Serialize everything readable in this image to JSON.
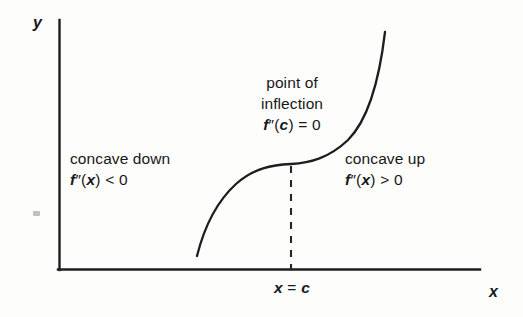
{
  "figure": {
    "background_color": "#fdfdfc",
    "ink_color": "#16181a"
  },
  "axes": {
    "y_label": "y",
    "x_label": "x",
    "origin": {
      "x": 59,
      "y": 270
    },
    "y_axis_top": 20,
    "x_axis_right": 480
  },
  "labels": {
    "point_of_inflection_line1": "point of",
    "point_of_inflection_line2": "inflection",
    "point_of_inflection_condition": "f″(c) = 0",
    "concave_down_title": "concave down",
    "concave_down_condition": "f″(x) < 0",
    "concave_up_title": "concave up",
    "concave_up_condition": "f″(x) > 0",
    "x_equals_c": "x = c"
  },
  "chart_data": {
    "type": "line",
    "title": "",
    "xlabel": "x",
    "ylabel": "y",
    "grid": false,
    "legend": "none",
    "annotations": [
      {
        "name": "point-of-inflection",
        "text": "point of inflection, f″(c) = 0",
        "at_x": 291,
        "at_y": 164
      },
      {
        "name": "concave-down-region",
        "text": "concave down, f″(x) < 0",
        "x_range": "x < c"
      },
      {
        "name": "concave-up-region",
        "text": "concave up, f″(x) > 0",
        "x_range": "x > c"
      },
      {
        "name": "x-equals-c-gridline",
        "text": "x = c",
        "at_x": 291
      }
    ],
    "series": [
      {
        "name": "f(x) (cubic-like, inflection at x = c)",
        "points": [
          [
            197,
            256
          ],
          [
            200,
            240
          ],
          [
            204,
            226
          ],
          [
            209,
            214
          ],
          [
            215,
            203
          ],
          [
            222,
            194
          ],
          [
            230,
            186
          ],
          [
            240,
            179
          ],
          [
            252,
            173
          ],
          [
            264,
            169
          ],
          [
            276,
            166
          ],
          [
            291,
            164
          ],
          [
            305,
            162
          ],
          [
            318,
            159
          ],
          [
            330,
            155
          ],
          [
            341,
            149
          ],
          [
            351,
            141
          ],
          [
            360,
            131
          ],
          [
            368,
            118
          ],
          [
            374,
            103
          ],
          [
            379,
            86
          ],
          [
            382,
            66
          ],
          [
            384,
            48
          ],
          [
            385,
            32
          ]
        ]
      }
    ],
    "reference_lines": [
      {
        "name": "x = c",
        "type": "vertical-dashed",
        "x": 291,
        "y_from": 165,
        "y_to": 270
      }
    ]
  }
}
